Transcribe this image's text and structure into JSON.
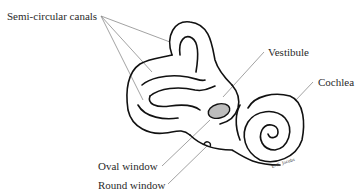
{
  "diagram": {
    "labels": {
      "semicircular_canals": "Semi-circular canals",
      "vestibule": "Vestibule",
      "cochlea": "Cochlea",
      "oval_window": "Oval window",
      "round_window": "Round window"
    },
    "signature": "E. K. Jacobs",
    "colors": {
      "line": "#111111",
      "leader": "#8a8a8a",
      "text": "#2a2a2a"
    }
  }
}
